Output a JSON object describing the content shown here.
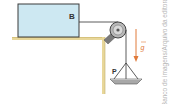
{
  "diagram": {
    "block_label": "B",
    "hanging_label": "P",
    "gravity_label": "g",
    "credit": "Banco de imagens/Arquivo da editora",
    "colors": {
      "block_fill": "#cde8f2",
      "block_stroke": "#3a3a3a",
      "table_edge": "#e8d79a",
      "table_fill": "#ffffff",
      "pulley": "#8a8a8a",
      "rope": "#333333",
      "gravity_arrow": "#e07a3a",
      "pan": "#9a9a9a",
      "credit_text": "#b5b5b5"
    }
  }
}
